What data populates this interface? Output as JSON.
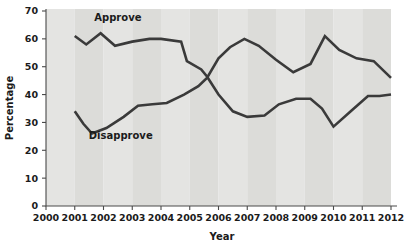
{
  "chart_data": {
    "type": "line",
    "title": "",
    "subtitle": "",
    "xlabel": "Year",
    "ylabel": "Percentage",
    "xlim": [
      2000,
      2012
    ],
    "ylim": [
      0,
      70
    ],
    "y_ticks": [
      0,
      10,
      20,
      30,
      40,
      50,
      60,
      70
    ],
    "x_ticks": [
      2000,
      2001,
      2002,
      2003,
      2004,
      2005,
      2006,
      2007,
      2008,
      2009,
      2010,
      2011,
      2012
    ],
    "grid": false,
    "legend_position": "inline-annotations",
    "annotations": [
      {
        "text": "Approve",
        "x": 2002.5,
        "y": 66.5
      },
      {
        "text": "Disapprove",
        "x": 2002.6,
        "y": 24.0
      }
    ],
    "series": [
      {
        "name": "Approve",
        "color": "#3a3a3a",
        "x": [
          2001.0,
          2001.4,
          2001.9,
          2002.4,
          2003.0,
          2003.6,
          2004.0,
          2004.7,
          2004.9,
          2005.4,
          2005.6,
          2006.0,
          2006.5,
          2007.0,
          2007.6,
          2008.1,
          2008.7,
          2009.2,
          2009.6,
          2010.0,
          2010.6,
          2011.2,
          2011.6,
          2012.0
        ],
        "y": [
          61.0,
          58.0,
          62.0,
          57.5,
          59.0,
          60.0,
          60.0,
          59.0,
          52.0,
          49.0,
          46.5,
          40.0,
          34.0,
          32.0,
          32.5,
          36.5,
          38.5,
          38.5,
          35.0,
          28.5,
          34.0,
          39.5,
          39.5,
          40.0
        ]
      },
      {
        "name": "Disapprove",
        "color": "#3a3a3a",
        "x": [
          2001.0,
          2001.3,
          2001.6,
          2002.1,
          2002.7,
          2003.2,
          2003.7,
          2004.2,
          2004.8,
          2005.3,
          2005.6,
          2006.0,
          2006.4,
          2006.9,
          2007.4,
          2008.0,
          2008.6,
          2009.2,
          2009.7,
          2010.2,
          2010.8,
          2011.4,
          2012.0
        ],
        "y": [
          34.0,
          29.5,
          26.0,
          28.0,
          32.0,
          36.0,
          36.5,
          37.0,
          40.0,
          43.0,
          46.0,
          53.0,
          57.0,
          60.0,
          57.5,
          52.5,
          48.0,
          51.0,
          61.0,
          56.0,
          53.0,
          52.0,
          46.0
        ]
      }
    ]
  },
  "axes": {
    "y_tick_labels": [
      "0",
      "10",
      "20",
      "30",
      "40",
      "50",
      "60",
      "70"
    ],
    "x_tick_labels": [
      "2000",
      "2001",
      "2002",
      "2003",
      "2004",
      "2005",
      "2006",
      "2007",
      "2008",
      "2009",
      "2010",
      "2011",
      "2012"
    ],
    "x_axis_title": "Year",
    "y_axis_title": "Percentage"
  },
  "labels": {
    "approve": "Approve",
    "disapprove": "Disapprove"
  },
  "colors": {
    "line": "#3a3a3a",
    "axis": "#4a4a4a",
    "band_light": "#e4e4e2",
    "band_dark": "#dcdcd9",
    "text": "#1b1b1b",
    "background": "#ffffff"
  }
}
